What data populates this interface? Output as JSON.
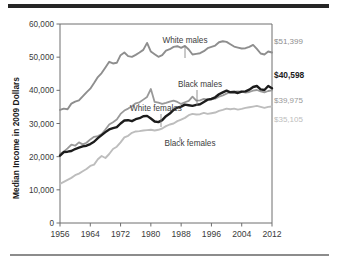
{
  "figure": {
    "top_rule_color": "#262626",
    "bottom_rule_color": "#8c8c8c",
    "background": "#ffffff"
  },
  "chart_data": {
    "type": "line",
    "title": "",
    "xlabel": "",
    "ylabel": "Median Income in 2009 Dollars",
    "xlim": [
      1956,
      2012
    ],
    "ylim": [
      0,
      60000
    ],
    "grid": false,
    "legend_position": "inline-annotations",
    "xticks": [
      "1956",
      "1964",
      "1972",
      "1980",
      "1988",
      "1996",
      "2004",
      "2012"
    ],
    "xtick_values": [
      1956,
      1964,
      1972,
      1980,
      1988,
      1996,
      2004,
      2012
    ],
    "yticks": [
      "0",
      "10,000",
      "20,000",
      "30,000",
      "40,000",
      "50,000",
      "60,000"
    ],
    "ytick_values": [
      0,
      10000,
      20000,
      30000,
      40000,
      50000,
      60000
    ],
    "x": [
      1956,
      1957,
      1958,
      1959,
      1960,
      1961,
      1962,
      1963,
      1964,
      1965,
      1966,
      1967,
      1968,
      1969,
      1970,
      1971,
      1972,
      1973,
      1974,
      1975,
      1976,
      1977,
      1978,
      1979,
      1980,
      1981,
      1982,
      1983,
      1984,
      1985,
      1986,
      1987,
      1988,
      1989,
      1990,
      1991,
      1992,
      1993,
      1994,
      1995,
      1996,
      1997,
      1998,
      1999,
      2000,
      2001,
      2002,
      2003,
      2004,
      2005,
      2006,
      2007,
      2008,
      2009,
      2010,
      2011,
      2012
    ],
    "series": [
      {
        "name": "White males",
        "color": "#8e8e8e",
        "width": 1.9,
        "end_value": 51399,
        "end_label": "$51,399",
        "label_color": "#8e8e8e",
        "values": [
          34100,
          34500,
          34300,
          36000,
          36600,
          37000,
          38200,
          39400,
          40500,
          42200,
          44000,
          45200,
          46900,
          48600,
          48100,
          48300,
          50600,
          51400,
          50300,
          50100,
          50700,
          51400,
          52200,
          54300,
          51700,
          50900,
          50100,
          50600,
          52000,
          52400,
          53100,
          53300,
          52800,
          53400,
          52300,
          50800,
          51000,
          51200,
          51800,
          52700,
          53100,
          53500,
          54500,
          54800,
          54600,
          53900,
          53200,
          52900,
          52600,
          52700,
          53100,
          53700,
          52500,
          51100,
          50800,
          51700,
          51399
        ]
      },
      {
        "name": "Black males",
        "color": "#1c1c1c",
        "width": 2.4,
        "end_value": 40598,
        "end_label": "$40,598",
        "label_color": "#1c1c1c",
        "values": [
          20300,
          21400,
          21500,
          21700,
          22300,
          22700,
          23100,
          23300,
          23800,
          24500,
          25600,
          26500,
          27400,
          28200,
          28600,
          28900,
          30000,
          30900,
          31000,
          30700,
          31300,
          31600,
          32200,
          32300,
          31500,
          30600,
          30400,
          31000,
          32200,
          33000,
          34100,
          34800,
          35100,
          35700,
          35500,
          35300,
          35600,
          35800,
          36500,
          37200,
          37400,
          37900,
          38800,
          39400,
          39900,
          39400,
          39500,
          39200,
          39600,
          39700,
          40200,
          41000,
          41300,
          40300,
          40100,
          41300,
          40598
        ]
      },
      {
        "name": "White females",
        "color": "#999999",
        "width": 1.8,
        "end_value": 39975,
        "end_label": "$39,975",
        "label_color": "#999999",
        "values": [
          20900,
          21500,
          22500,
          23600,
          23300,
          24300,
          23700,
          24200,
          25200,
          26000,
          26200,
          26800,
          28200,
          29700,
          30400,
          31200,
          32900,
          33900,
          34500,
          35200,
          36100,
          36400,
          37200,
          38000,
          40400,
          36500,
          36300,
          35900,
          36200,
          36600,
          36900,
          36500,
          35900,
          36400,
          36800,
          38100,
          36900,
          37000,
          37400,
          37200,
          37300,
          37500,
          38100,
          38500,
          39000,
          39500,
          39600,
          39700,
          39600,
          39300,
          39500,
          39900,
          40100,
          39700,
          39400,
          39800,
          39975
        ]
      },
      {
        "name": "Black females",
        "color": "#bdbdbd",
        "width": 1.9,
        "end_value": 35105,
        "end_label": "$35,105",
        "label_color": "#bdbdbd",
        "values": [
          11800,
          12400,
          13000,
          13600,
          14400,
          14900,
          15600,
          16300,
          17200,
          17600,
          19200,
          20200,
          19600,
          20800,
          22300,
          23000,
          24300,
          25800,
          26300,
          27200,
          27600,
          27700,
          27900,
          28000,
          28100,
          27900,
          28100,
          28500,
          29200,
          29700,
          30000,
          30700,
          31200,
          31700,
          32500,
          32900,
          32700,
          32800,
          33200,
          32900,
          33100,
          33300,
          33800,
          34100,
          34500,
          34300,
          34500,
          34200,
          34400,
          34700,
          34900,
          35100,
          35300,
          35000,
          34700,
          35000,
          35105
        ]
      }
    ],
    "annotations": [
      {
        "text": "White males",
        "series": "White males"
      },
      {
        "text": "Black males",
        "series": "Black males"
      },
      {
        "text": "White females",
        "series": "White females"
      },
      {
        "text": "Black females",
        "series": "Black females"
      }
    ]
  }
}
